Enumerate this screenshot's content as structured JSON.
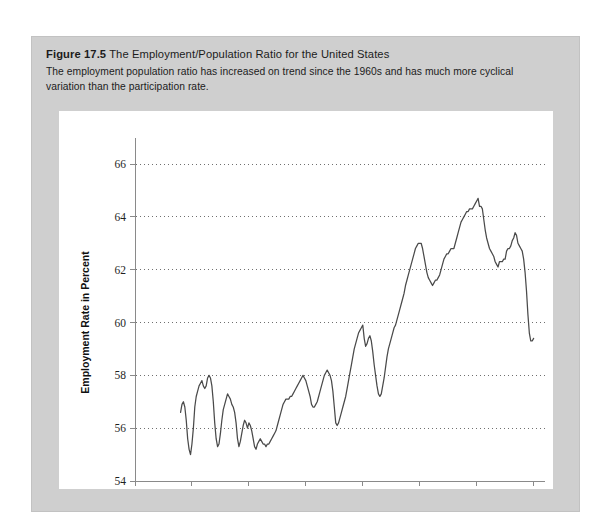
{
  "figure": {
    "number": "Figure 17.5",
    "title": "The Employment/Population Ratio for the United States",
    "caption": "The employment population ratio has increased on trend since the 1960s and has much more cyclical variation than the participation rate."
  },
  "colors": {
    "panel_background": "#cfcfcf",
    "plot_background": "#ffffff",
    "series_line": "#4a4a4a",
    "grid_line": "#6f6f6f",
    "axis_line": "#8a8a8a",
    "text": "#1c1c1c"
  },
  "chart_data": {
    "type": "line",
    "title": "The Employment/Population Ratio for the United States",
    "xlabel": "Year",
    "ylabel": "Employment Rate in Percent",
    "xlim": [
      1940,
      2012
    ],
    "ylim": [
      54,
      66
    ],
    "xticks": [
      1940,
      1950,
      1960,
      1970,
      1980,
      1990,
      2000,
      2010
    ],
    "yticks": [
      54,
      56,
      58,
      60,
      62,
      64,
      66
    ],
    "grid": "horizontal-dotted",
    "legend": null,
    "series": [
      {
        "name": "Employment/Population Ratio",
        "x": [
          1948.0,
          1948.25,
          1948.5,
          1948.75,
          1949.0,
          1949.25,
          1949.5,
          1949.75,
          1950.0,
          1950.25,
          1950.5,
          1950.75,
          1951.0,
          1951.25,
          1951.5,
          1951.75,
          1952.0,
          1952.25,
          1952.5,
          1952.75,
          1953.0,
          1953.25,
          1953.5,
          1953.75,
          1954.0,
          1954.25,
          1954.5,
          1954.75,
          1955.0,
          1955.25,
          1955.5,
          1955.75,
          1956.0,
          1956.25,
          1956.5,
          1956.75,
          1957.0,
          1957.25,
          1957.5,
          1957.75,
          1958.0,
          1958.25,
          1958.5,
          1958.75,
          1959.0,
          1959.25,
          1959.5,
          1959.75,
          1960.0,
          1960.25,
          1960.5,
          1960.75,
          1961.0,
          1961.25,
          1961.5,
          1961.75,
          1962.0,
          1962.25,
          1962.5,
          1962.75,
          1963.0,
          1963.25,
          1963.5,
          1963.75,
          1964.0,
          1964.25,
          1964.5,
          1964.75,
          1965.0,
          1965.25,
          1965.5,
          1965.75,
          1966.0,
          1966.25,
          1966.5,
          1966.75,
          1967.0,
          1967.25,
          1967.5,
          1967.75,
          1968.0,
          1968.25,
          1968.5,
          1968.75,
          1969.0,
          1969.25,
          1969.5,
          1969.75,
          1970.0,
          1970.25,
          1970.5,
          1970.75,
          1971.0,
          1971.25,
          1971.5,
          1971.75,
          1972.0,
          1972.25,
          1972.5,
          1972.75,
          1973.0,
          1973.25,
          1973.5,
          1973.75,
          1974.0,
          1974.25,
          1974.5,
          1974.75,
          1975.0,
          1975.25,
          1975.5,
          1975.75,
          1976.0,
          1976.25,
          1976.5,
          1976.75,
          1977.0,
          1977.25,
          1977.5,
          1977.75,
          1978.0,
          1978.25,
          1978.5,
          1978.75,
          1979.0,
          1979.25,
          1979.5,
          1979.75,
          1980.0,
          1980.25,
          1980.5,
          1980.75,
          1981.0,
          1981.25,
          1981.5,
          1981.75,
          1982.0,
          1982.25,
          1982.5,
          1982.75,
          1983.0,
          1983.25,
          1983.5,
          1983.75,
          1984.0,
          1984.25,
          1984.5,
          1984.75,
          1985.0,
          1985.25,
          1985.5,
          1985.75,
          1986.0,
          1986.25,
          1986.5,
          1986.75,
          1987.0,
          1987.25,
          1987.5,
          1987.75,
          1988.0,
          1988.25,
          1988.5,
          1988.75,
          1989.0,
          1989.25,
          1989.5,
          1989.75,
          1990.0,
          1990.25,
          1990.5,
          1990.75,
          1991.0,
          1991.25,
          1991.5,
          1991.75,
          1992.0,
          1992.25,
          1992.5,
          1992.75,
          1993.0,
          1993.25,
          1993.5,
          1993.75,
          1994.0,
          1994.25,
          1994.5,
          1994.75,
          1995.0,
          1995.25,
          1995.5,
          1995.75,
          1996.0,
          1996.25,
          1996.5,
          1996.75,
          1997.0,
          1997.25,
          1997.5,
          1997.75,
          1998.0,
          1998.25,
          1998.5,
          1998.75,
          1999.0,
          1999.25,
          1999.5,
          1999.75,
          2000.0,
          2000.25,
          2000.5,
          2000.75,
          2001.0,
          2001.25,
          2001.5,
          2001.75,
          2002.0,
          2002.25,
          2002.5,
          2002.75,
          2003.0,
          2003.25,
          2003.5,
          2003.75,
          2004.0,
          2004.25,
          2004.5,
          2004.75,
          2005.0,
          2005.25,
          2005.5,
          2005.75,
          2006.0,
          2006.25,
          2006.5,
          2006.75,
          2007.0,
          2007.25,
          2007.5,
          2007.75,
          2008.0,
          2008.25,
          2008.5,
          2008.75,
          2009.0,
          2009.25,
          2009.5,
          2009.75,
          2010.0
        ],
        "y": [
          56.6,
          56.9,
          57.0,
          56.8,
          56.3,
          55.6,
          55.2,
          55.0,
          55.4,
          56.0,
          56.8,
          57.2,
          57.4,
          57.6,
          57.7,
          57.8,
          57.6,
          57.5,
          57.6,
          57.9,
          58.0,
          57.9,
          57.6,
          57.0,
          56.2,
          55.6,
          55.3,
          55.4,
          55.8,
          56.3,
          56.7,
          56.9,
          57.1,
          57.3,
          57.2,
          57.1,
          56.9,
          56.8,
          56.6,
          56.2,
          55.6,
          55.3,
          55.5,
          55.8,
          56.1,
          56.3,
          56.2,
          56.0,
          56.2,
          56.1,
          55.9,
          55.6,
          55.3,
          55.2,
          55.4,
          55.5,
          55.6,
          55.5,
          55.4,
          55.4,
          55.3,
          55.4,
          55.4,
          55.5,
          55.6,
          55.7,
          55.8,
          55.9,
          56.1,
          56.3,
          56.5,
          56.7,
          56.9,
          57.0,
          57.1,
          57.1,
          57.1,
          57.2,
          57.2,
          57.3,
          57.4,
          57.5,
          57.6,
          57.7,
          57.8,
          57.9,
          58.0,
          57.9,
          57.8,
          57.6,
          57.4,
          57.2,
          56.9,
          56.8,
          56.8,
          56.9,
          57.0,
          57.2,
          57.4,
          57.6,
          57.8,
          58.0,
          58.1,
          58.2,
          58.1,
          58.0,
          57.8,
          57.4,
          56.8,
          56.2,
          56.1,
          56.2,
          56.4,
          56.6,
          56.8,
          57.0,
          57.2,
          57.5,
          57.8,
          58.1,
          58.4,
          58.7,
          59.0,
          59.2,
          59.4,
          59.6,
          59.7,
          59.8,
          59.9,
          59.4,
          59.1,
          59.2,
          59.4,
          59.5,
          59.3,
          58.9,
          58.4,
          58.0,
          57.6,
          57.3,
          57.2,
          57.3,
          57.6,
          57.9,
          58.3,
          58.7,
          59.0,
          59.2,
          59.4,
          59.6,
          59.8,
          59.9,
          60.1,
          60.3,
          60.5,
          60.7,
          60.9,
          61.1,
          61.4,
          61.6,
          61.8,
          62.0,
          62.2,
          62.4,
          62.6,
          62.8,
          62.9,
          63.0,
          63.0,
          63.0,
          62.8,
          62.5,
          62.2,
          61.9,
          61.7,
          61.6,
          61.5,
          61.4,
          61.5,
          61.6,
          61.6,
          61.7,
          61.8,
          62.0,
          62.2,
          62.4,
          62.5,
          62.6,
          62.6,
          62.7,
          62.8,
          62.8,
          62.8,
          63.0,
          63.2,
          63.4,
          63.6,
          63.8,
          63.9,
          64.0,
          64.1,
          64.2,
          64.2,
          64.3,
          64.3,
          64.3,
          64.4,
          64.5,
          64.6,
          64.7,
          64.4,
          64.4,
          64.3,
          63.9,
          63.5,
          63.2,
          63.0,
          62.8,
          62.7,
          62.6,
          62.5,
          62.3,
          62.2,
          62.1,
          62.3,
          62.3,
          62.3,
          62.4,
          62.4,
          62.7,
          62.8,
          62.8,
          62.9,
          63.1,
          63.2,
          63.4,
          63.3,
          63.0,
          62.9,
          62.8,
          62.7,
          62.4,
          61.9,
          61.2,
          60.3,
          59.6,
          59.3,
          59.3,
          59.4
        ]
      }
    ]
  },
  "axes": {
    "x_tick_labels": [
      "1940",
      "1950",
      "1960",
      "1970",
      "1980",
      "1990",
      "2000",
      "2010"
    ],
    "y_tick_labels": [
      "54",
      "56",
      "58",
      "60",
      "62",
      "64",
      "66"
    ],
    "x_title": "Year",
    "y_title": "Employment Rate in Percent"
  }
}
